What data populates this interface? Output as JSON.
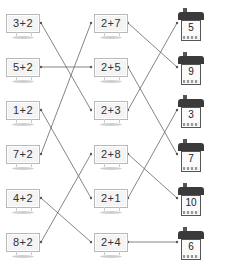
{
  "left_signs": [
    {
      "label": "3+2"
    },
    {
      "label": "5+2"
    },
    {
      "label": "1+2"
    },
    {
      "label": "7+2"
    },
    {
      "label": "4+2"
    },
    {
      "label": "8+2"
    }
  ],
  "middle_signs": [
    {
      "label": "2+7"
    },
    {
      "label": "2+5"
    },
    {
      "label": "2+3"
    },
    {
      "label": "2+8"
    },
    {
      "label": "2+1"
    },
    {
      "label": "2+4"
    }
  ],
  "houses": [
    {
      "label": "5"
    },
    {
      "label": "9"
    },
    {
      "label": "3"
    },
    {
      "label": "7"
    },
    {
      "label": "10"
    },
    {
      "label": "6"
    }
  ],
  "connections_left_to_middle": [
    {
      "from": "3+2",
      "to": "2+3"
    },
    {
      "from": "5+2",
      "to": "2+5"
    },
    {
      "from": "1+2",
      "to": "2+1"
    },
    {
      "from": "7+2",
      "to": "2+7"
    },
    {
      "from": "4+2",
      "to": "2+4"
    },
    {
      "from": "8+2",
      "to": "2+8"
    }
  ],
  "connections_middle_to_house": [
    {
      "from": "2+7",
      "to": "9"
    },
    {
      "from": "2+5",
      "to": "7"
    },
    {
      "from": "2+3",
      "to": "5"
    },
    {
      "from": "2+8",
      "to": "10"
    },
    {
      "from": "2+1",
      "to": "3"
    },
    {
      "from": "2+4",
      "to": "6"
    }
  ]
}
